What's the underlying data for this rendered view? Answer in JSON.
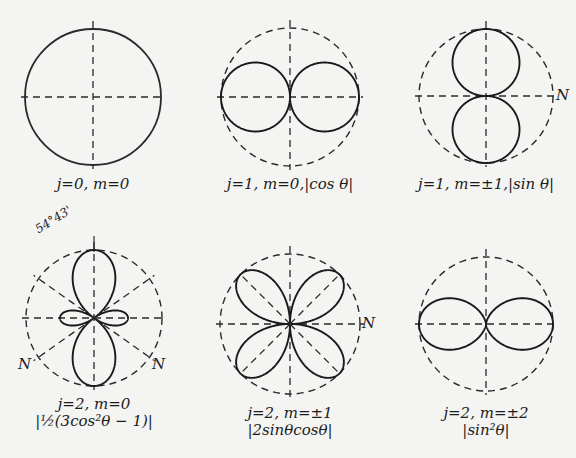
{
  "figure": {
    "background": "#f4f4f2",
    "ink": "#1a1a1a",
    "panels": [
      {
        "id": "j0m0",
        "center": [
          93,
          97
        ],
        "radius": 68,
        "formula": "1",
        "caption_line1": "j=0, m=0",
        "caption_line2": "",
        "caption_pos": [
          93,
          176
        ],
        "ref_style": "solid"
      },
      {
        "id": "j1m0",
        "center": [
          290,
          97
        ],
        "radius": 69,
        "formula": "|cos θ|",
        "caption_line1": "j=1,  m=0,|cos θ|",
        "caption_line2": "",
        "caption_pos": [
          290,
          176
        ],
        "ref_style": "dashed"
      },
      {
        "id": "j1m1",
        "center": [
          486,
          96
        ],
        "radius": 67,
        "formula": "|sin θ|",
        "caption_line1": "j=1, m=±1,|sin θ|",
        "caption_line2": "",
        "caption_pos": [
          486,
          176
        ],
        "ref_style": "dashed",
        "n_label": {
          "text": "N",
          "pos": [
            556,
            86
          ]
        }
      },
      {
        "id": "j2m0",
        "center": [
          94,
          318
        ],
        "radius": 68,
        "formula": "|½(3cos²θ − 1)|",
        "caption_line1": "j=2, m=0",
        "caption_line2": "|½(3cos²θ − 1)|",
        "caption_pos": [
          94,
          396
        ],
        "ref_style": "dashed",
        "angle_label": "54°43'",
        "n_labels": [
          {
            "text": "N",
            "pos": [
              18,
              355
            ]
          },
          {
            "text": "N",
            "pos": [
              152,
              355
            ]
          }
        ]
      },
      {
        "id": "j2m1",
        "center": [
          290,
          324
        ],
        "radius": 70,
        "formula": "|2 sin θ cos θ|",
        "caption_line1": "j=2, m=±1",
        "caption_line2": "|2sinθcosθ|",
        "caption_pos": [
          290,
          405
        ],
        "ref_style": "dashed",
        "n_label": {
          "text": "N",
          "pos": [
            362,
            314
          ]
        }
      },
      {
        "id": "j2m2",
        "center": [
          486,
          324
        ],
        "radius": 67,
        "formula": "|sin² θ|",
        "caption_line1": "j=2, m=±2",
        "caption_line2": "|sin²θ|",
        "caption_pos": [
          486,
          405
        ],
        "ref_style": "dashed"
      }
    ]
  }
}
